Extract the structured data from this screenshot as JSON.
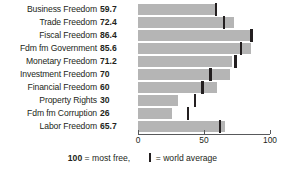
{
  "chart_data": {
    "type": "bar",
    "orientation": "horizontal",
    "title": "",
    "xlabel": "",
    "ylabel": "",
    "xlim": [
      0,
      100
    ],
    "grid": false,
    "categories": [
      "Business Freedom",
      "Trade Freedom",
      "Fiscal Freedom",
      "Fdm fm Government",
      "Monetary Freedom",
      "Investment Freedom",
      "Financial Freedom",
      "Property Rights",
      "Fdm fm Corruption",
      "Labor Freedom"
    ],
    "values": [
      59.7,
      72.4,
      86.4,
      85.6,
      71.2,
      70,
      60,
      30,
      26,
      65.7
    ],
    "value_labels": [
      "59.7",
      "72.4",
      "86.4",
      "85.6",
      "71.2",
      "70",
      "60",
      "30",
      "26",
      "65.7"
    ],
    "series": [
      {
        "name": "Score",
        "values": [
          59.7,
          72.4,
          86.4,
          85.6,
          71.2,
          70,
          60,
          30,
          26,
          65.7
        ]
      },
      {
        "name": "World average",
        "marker": "tick",
        "values": [
          59,
          65,
          86,
          78,
          74,
          55,
          49,
          43,
          38,
          62
        ]
      }
    ],
    "xticks": [
      0,
      50,
      100
    ],
    "xtick_labels": [
      "0",
      "50",
      "100"
    ],
    "colors": {
      "bar": "#b5b5b5",
      "tick": "#231f20",
      "axis": "#58595b",
      "text": "#231f20",
      "background": "#ffffff"
    }
  },
  "legend": {
    "most_free_value": "100",
    "most_free_text": " = most free,",
    "world_average_text": " = world average"
  }
}
